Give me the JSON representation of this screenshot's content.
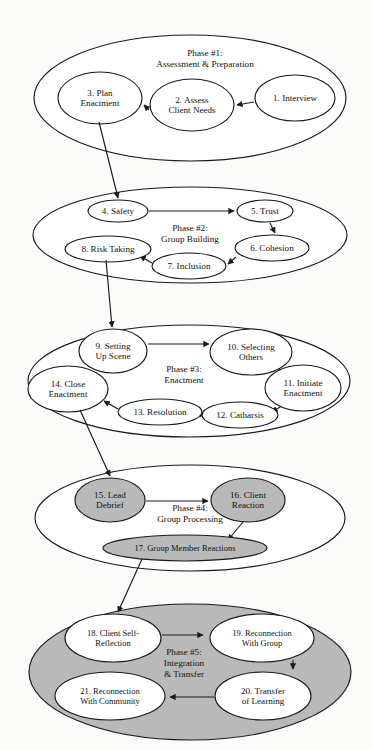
{
  "diagram": {
    "colors": {
      "fill_gray": "#b9b9b9",
      "stroke": "#1a1a1a",
      "fill_white": "#ffffff",
      "background": "#fbfbfa"
    },
    "phases": [
      {
        "id": "phase-1",
        "label_lines": [
          "Phase #1:",
          "Assessment & Preparation"
        ],
        "filled": false,
        "ellipse": {
          "cx": 190,
          "cy": 98,
          "rx": 156,
          "ry": 63
        },
        "label_pos": {
          "x": 205,
          "y": 58
        },
        "nodes": [
          {
            "id": "node-1",
            "text_lines": [
              "1. Interview"
            ],
            "cx": 295,
            "cy": 98,
            "rx": 40,
            "ry": 23,
            "gray": false
          },
          {
            "id": "node-2",
            "text_lines": [
              "2. Assess",
              "Client Needs"
            ],
            "cx": 192,
            "cy": 105,
            "rx": 42,
            "ry": 26,
            "gray": false
          },
          {
            "id": "node-3",
            "text_lines": [
              "3. Plan",
              "Enactment"
            ],
            "cx": 100,
            "cy": 98,
            "rx": 42,
            "ry": 26,
            "gray": false
          }
        ],
        "edges": [
          {
            "id": "edge-1-2",
            "from": "node-1",
            "to": "node-2",
            "x1": 254,
            "y1": 102,
            "x2": 237,
            "y2": 105
          },
          {
            "id": "edge-2-3",
            "from": "node-2",
            "to": "node-3",
            "x1": 149,
            "y1": 110,
            "x2": 144,
            "y2": 105
          }
        ]
      },
      {
        "id": "phase-2",
        "label_lines": [
          "Phase #2:",
          "Group Building"
        ],
        "filled": false,
        "ellipse": {
          "cx": 190,
          "cy": 235,
          "rx": 157,
          "ry": 48
        },
        "label_pos": {
          "x": 190,
          "y": 233
        },
        "nodes": [
          {
            "id": "node-4",
            "text_lines": [
              "4. Safety"
            ],
            "cx": 118,
            "cy": 211,
            "rx": 30,
            "ry": 11,
            "gray": false
          },
          {
            "id": "node-5",
            "text_lines": [
              "5. Trust"
            ],
            "cx": 265,
            "cy": 211,
            "rx": 28,
            "ry": 11,
            "gray": false
          },
          {
            "id": "node-6",
            "text_lines": [
              "6. Cohesion"
            ],
            "cx": 272,
            "cy": 248,
            "rx": 37,
            "ry": 13,
            "gray": false
          },
          {
            "id": "node-7",
            "text_lines": [
              "7. Inclusion"
            ],
            "cx": 189,
            "cy": 266,
            "rx": 37,
            "ry": 13,
            "gray": false
          },
          {
            "id": "node-8",
            "text_lines": [
              "8. Risk Taking"
            ],
            "cx": 108,
            "cy": 249,
            "rx": 43,
            "ry": 13,
            "gray": false
          }
        ],
        "edges": [
          {
            "id": "edge-4-5",
            "from": "node-4",
            "to": "node-5",
            "x1": 149,
            "y1": 211,
            "x2": 234,
            "y2": 211
          },
          {
            "id": "edge-5-6",
            "from": "node-5",
            "to": "node-6",
            "x1": 270,
            "y1": 223,
            "x2": 275,
            "y2": 233
          },
          {
            "id": "edge-6-7",
            "from": "node-6",
            "to": "node-7",
            "x1": 236,
            "y1": 257,
            "x2": 228,
            "y2": 264
          },
          {
            "id": "edge-7-8",
            "from": "node-7",
            "to": "node-8",
            "x1": 152,
            "y1": 263,
            "x2": 140,
            "y2": 256
          }
        ]
      },
      {
        "id": "phase-3",
        "label_lines": [
          "Phase #3:",
          "Enactment"
        ],
        "filled": false,
        "ellipse": {
          "cx": 189,
          "cy": 381,
          "rx": 161,
          "ry": 56
        },
        "label_pos": {
          "x": 184,
          "y": 374
        },
        "nodes": [
          {
            "id": "node-9",
            "text_lines": [
              "9. Setting",
              "Up Scene"
            ],
            "cx": 113,
            "cy": 351,
            "rx": 34,
            "ry": 22,
            "gray": false
          },
          {
            "id": "node-10",
            "text_lines": [
              "10. Selecting",
              "Others"
            ],
            "cx": 251,
            "cy": 352,
            "rx": 41,
            "ry": 23,
            "gray": false
          },
          {
            "id": "node-11",
            "text_lines": [
              "11. Initiate",
              "Enactment"
            ],
            "cx": 303,
            "cy": 388,
            "rx": 38,
            "ry": 23,
            "gray": false
          },
          {
            "id": "node-12",
            "text_lines": [
              "12. Catharsis"
            ],
            "cx": 240,
            "cy": 415,
            "rx": 38,
            "ry": 13,
            "gray": false
          },
          {
            "id": "node-13",
            "text_lines": [
              "13. Resolution"
            ],
            "cx": 160,
            "cy": 412,
            "rx": 42,
            "ry": 13,
            "gray": false
          },
          {
            "id": "node-14",
            "text_lines": [
              "14. Close",
              "Enactment"
            ],
            "cx": 68,
            "cy": 389,
            "rx": 40,
            "ry": 23,
            "gray": false
          }
        ],
        "edges": [
          {
            "id": "edge-9-10",
            "from": "node-9",
            "to": "node-10",
            "x1": 148,
            "y1": 344,
            "x2": 209,
            "y2": 344
          },
          {
            "id": "edge-10-11",
            "from": "node-10",
            "to": "node-11",
            "x1": 279,
            "y1": 369,
            "x2": 291,
            "y2": 381
          },
          {
            "id": "edge-11-12",
            "from": "node-11",
            "to": "node-12",
            "x1": 288,
            "y1": 402,
            "x2": 272,
            "y2": 412
          },
          {
            "id": "edge-12-13",
            "from": "node-12",
            "to": "node-13",
            "x1": 201,
            "y1": 414,
            "x2": 205,
            "y2": 413
          },
          {
            "id": "edge-13-14",
            "from": "node-13",
            "to": "node-14",
            "x1": 118,
            "y1": 409,
            "x2": 104,
            "y2": 401
          }
        ]
      },
      {
        "id": "phase-4",
        "label_lines": [
          "Phase #4:",
          "Group Processing"
        ],
        "filled": false,
        "ellipse": {
          "cx": 190,
          "cy": 518,
          "rx": 155,
          "ry": 53
        },
        "label_pos": {
          "x": 190,
          "y": 513
        },
        "nodes": [
          {
            "id": "node-15",
            "text_lines": [
              "15. Lead",
              "Debrief"
            ],
            "cx": 110,
            "cy": 500,
            "rx": 35,
            "ry": 22,
            "gray": true
          },
          {
            "id": "node-16",
            "text_lines": [
              "16. Client",
              "Reaction"
            ],
            "cx": 248,
            "cy": 500,
            "rx": 37,
            "ry": 22,
            "gray": true
          },
          {
            "id": "node-17",
            "text_lines": [
              "17. Group Member Reactions"
            ],
            "cx": 185,
            "cy": 548,
            "rx": 82,
            "ry": 13,
            "gray": true
          }
        ],
        "edges": [
          {
            "id": "edge-15-16",
            "from": "node-15",
            "to": "node-16",
            "x1": 146,
            "y1": 501,
            "x2": 208,
            "y2": 501
          },
          {
            "id": "edge-16-17",
            "from": "node-16",
            "to": "node-17",
            "x1": 243,
            "y1": 522,
            "x2": 228,
            "y2": 540
          }
        ]
      },
      {
        "id": "phase-5",
        "label_lines": [
          "Phase #5:",
          "Integration",
          "& Transfer"
        ],
        "filled": true,
        "ellipse": {
          "cx": 190,
          "cy": 672,
          "rx": 161,
          "ry": 68
        },
        "label_pos": {
          "x": 184,
          "y": 663
        },
        "nodes": [
          {
            "id": "node-18",
            "text_lines": [
              "18. Client Self-",
              "Reflection"
            ],
            "cx": 113,
            "cy": 638,
            "rx": 48,
            "ry": 24,
            "gray": false
          },
          {
            "id": "node-19",
            "text_lines": [
              "19. Reconnection",
              "With Group"
            ],
            "cx": 262,
            "cy": 638,
            "rx": 52,
            "ry": 24,
            "gray": false
          },
          {
            "id": "node-20",
            "text_lines": [
              "20. Transfer",
              "of Learning"
            ],
            "cx": 263,
            "cy": 696,
            "rx": 48,
            "ry": 24,
            "gray": false
          },
          {
            "id": "node-21",
            "text_lines": [
              "21. Reconnection",
              "With Community"
            ],
            "cx": 110,
            "cy": 696,
            "rx": 55,
            "ry": 24,
            "gray": false
          }
        ],
        "edges": [
          {
            "id": "edge-18-19",
            "from": "node-18",
            "to": "node-19",
            "x1": 162,
            "y1": 635,
            "x2": 203,
            "y2": 635
          },
          {
            "id": "edge-19-20",
            "from": "node-19",
            "to": "node-20",
            "x1": 293,
            "y1": 660,
            "x2": 293,
            "y2": 669
          },
          {
            "id": "edge-20-21",
            "from": "node-20",
            "to": "node-21",
            "x1": 214,
            "y1": 697,
            "x2": 170,
            "y2": 697
          }
        ]
      }
    ],
    "phase_connectors": [
      {
        "id": "connector-3-4",
        "from": "node-3",
        "to": "node-4",
        "x1": 99,
        "y1": 122,
        "x2": 118,
        "y2": 198
      },
      {
        "id": "connector-8-9",
        "from": "node-8",
        "to": "node-9",
        "x1": 106,
        "y1": 260,
        "x2": 112,
        "y2": 327
      },
      {
        "id": "connector-14-15",
        "from": "node-14",
        "to": "node-15",
        "x1": 80,
        "y1": 410,
        "x2": 110,
        "y2": 476
      },
      {
        "id": "connector-17-18",
        "from": "node-17",
        "to": "node-18",
        "x1": 142,
        "y1": 559,
        "x2": 118,
        "y2": 612
      }
    ]
  }
}
